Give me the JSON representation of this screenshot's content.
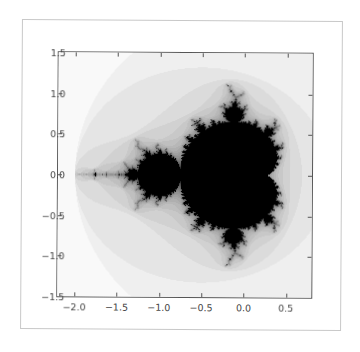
{
  "chart_data": {
    "type": "heatmap",
    "title": "",
    "subtitle": "",
    "xlabel": "",
    "ylabel": "",
    "xlim": [
      -2.2,
      0.8
    ],
    "ylim": [
      -1.5,
      1.5
    ],
    "x_ticks": [
      -2.0,
      -1.5,
      -1.0,
      -0.5,
      0.0,
      0.5
    ],
    "x_tick_labels": [
      "−2.0",
      "−1.5",
      "−1.0",
      "−0.5",
      "0.0",
      "0.5"
    ],
    "y_ticks": [
      1.5,
      1.0,
      0.5,
      0.0,
      -0.5,
      -1.0,
      -1.5
    ],
    "y_tick_labels": [
      "1.5",
      "1.0",
      "0.5",
      "0.0",
      "−0.5",
      "−1.0",
      "−1.5"
    ],
    "grid": false,
    "legend": null,
    "colormap": "gray_r",
    "max_iterations": 40,
    "colors": {
      "inside": "#000000",
      "background": "#ffffff",
      "axes": "#555555",
      "tick_text": "#444444",
      "frame": "#c8c8c8"
    }
  }
}
